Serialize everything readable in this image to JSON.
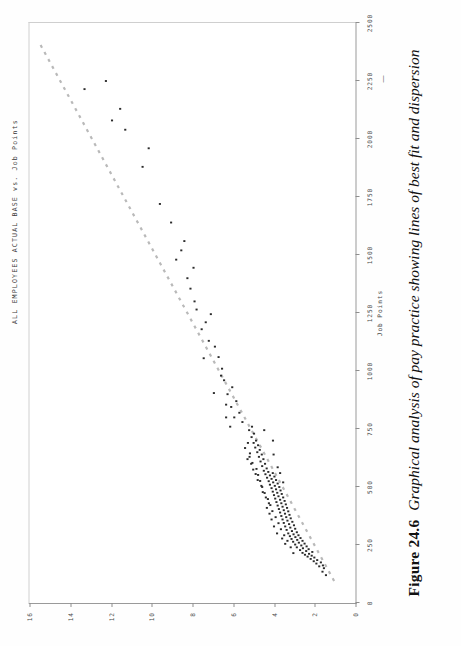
{
  "figure": {
    "number_label": "Figure 24.6",
    "caption_text": "Graphical analysis of pay practice showing lines of best fit and dispersion"
  },
  "chart_title": "ALL EMPLOYEES ACTUAL BASE vs. Job Points",
  "axis_marker_dash": "—",
  "colors": {
    "point": "#2b2b2b",
    "trendline": "#b9b9b9",
    "axis": "#8e8e8e",
    "frame": "#cfcfcf",
    "background": "#ffffff",
    "text": "#1a1a1a"
  },
  "chart_data": {
    "type": "scatter",
    "title": "ALL EMPLOYEES ACTUAL BASE vs. Job Points",
    "xlabel": "Job Points",
    "ylabel": "",
    "xlim": [
      0,
      2500
    ],
    "ylim": [
      0,
      16
    ],
    "grid": false,
    "legend": "none",
    "xticks": [
      0,
      250,
      500,
      750,
      1000,
      1250,
      1500,
      1750,
      2000,
      2250,
      2500
    ],
    "xtick_labels": [
      "0",
      "250",
      "500",
      "750",
      "1000",
      "1250",
      "1500",
      "1750",
      "2000",
      "2250",
      "2500"
    ],
    "yticks": [
      0,
      2,
      4,
      6,
      8,
      10,
      12,
      14,
      16
    ],
    "ytick_labels": [
      "0",
      "2",
      "4",
      "6",
      "8",
      "10",
      "12",
      "14",
      "16"
    ],
    "annotations": [
      "Job Points axis label placed beneath the 1250 tick"
    ],
    "series": [
      {
        "name": "Line of best fit",
        "type": "line",
        "style": "dotted",
        "color": "#b9b9b9",
        "x": [
          95,
          2420
        ],
        "y": [
          1.05,
          15.55
        ]
      },
      {
        "name": "Actual base salary",
        "type": "scatter",
        "color": "#2b2b2b",
        "points": [
          [
            120,
            1.45
          ],
          [
            135,
            1.62
          ],
          [
            150,
            1.55
          ],
          [
            158,
            1.78
          ],
          [
            162,
            1.6
          ],
          [
            170,
            1.92
          ],
          [
            175,
            1.7
          ],
          [
            180,
            2.05
          ],
          [
            185,
            1.88
          ],
          [
            190,
            2.2
          ],
          [
            196,
            2.02
          ],
          [
            200,
            2.35
          ],
          [
            204,
            2.15
          ],
          [
            208,
            2.48
          ],
          [
            212,
            2.28
          ],
          [
            216,
            2.6
          ],
          [
            220,
            2.12
          ],
          [
            224,
            2.42
          ],
          [
            228,
            2.72
          ],
          [
            232,
            2.3
          ],
          [
            236,
            2.58
          ],
          [
            240,
            2.88
          ],
          [
            244,
            2.4
          ],
          [
            248,
            2.66
          ],
          [
            252,
            2.96
          ],
          [
            256,
            2.5
          ],
          [
            260,
            2.78
          ],
          [
            264,
            3.06
          ],
          [
            268,
            2.6
          ],
          [
            272,
            2.86
          ],
          [
            276,
            3.14
          ],
          [
            280,
            2.7
          ],
          [
            284,
            2.95
          ],
          [
            288,
            3.22
          ],
          [
            292,
            2.8
          ],
          [
            296,
            3.04
          ],
          [
            300,
            3.3
          ],
          [
            305,
            2.88
          ],
          [
            310,
            3.12
          ],
          [
            315,
            3.38
          ],
          [
            320,
            2.96
          ],
          [
            325,
            3.2
          ],
          [
            330,
            3.45
          ],
          [
            335,
            3.02
          ],
          [
            340,
            3.26
          ],
          [
            345,
            3.52
          ],
          [
            350,
            3.1
          ],
          [
            355,
            3.34
          ],
          [
            360,
            3.58
          ],
          [
            365,
            3.18
          ],
          [
            370,
            3.4
          ],
          [
            375,
            3.64
          ],
          [
            380,
            3.24
          ],
          [
            385,
            3.46
          ],
          [
            390,
            3.7
          ],
          [
            395,
            3.3
          ],
          [
            400,
            3.52
          ],
          [
            405,
            3.76
          ],
          [
            410,
            3.36
          ],
          [
            415,
            3.58
          ],
          [
            420,
            3.82
          ],
          [
            425,
            3.42
          ],
          [
            430,
            3.64
          ],
          [
            435,
            3.88
          ],
          [
            440,
            3.48
          ],
          [
            445,
            3.7
          ],
          [
            450,
            3.94
          ],
          [
            455,
            3.55
          ],
          [
            460,
            3.78
          ],
          [
            465,
            4.0
          ],
          [
            470,
            3.62
          ],
          [
            475,
            3.84
          ],
          [
            480,
            4.06
          ],
          [
            485,
            3.68
          ],
          [
            490,
            3.9
          ],
          [
            495,
            4.12
          ],
          [
            500,
            3.74
          ],
          [
            505,
            3.96
          ],
          [
            510,
            4.2
          ],
          [
            515,
            3.82
          ],
          [
            520,
            4.04
          ],
          [
            525,
            4.26
          ],
          [
            530,
            3.9
          ],
          [
            535,
            4.12
          ],
          [
            540,
            4.34
          ],
          [
            545,
            3.98
          ],
          [
            550,
            4.2
          ],
          [
            555,
            4.42
          ],
          [
            560,
            4.06
          ],
          [
            565,
            4.28
          ],
          [
            570,
            4.5
          ],
          [
            580,
            4.36
          ],
          [
            590,
            4.58
          ],
          [
            600,
            4.44
          ],
          [
            610,
            4.66
          ],
          [
            620,
            4.52
          ],
          [
            630,
            4.74
          ],
          [
            640,
            4.6
          ],
          [
            650,
            4.82
          ],
          [
            660,
            4.7
          ],
          [
            670,
            4.92
          ],
          [
            680,
            4.78
          ],
          [
            690,
            5.0
          ],
          [
            700,
            4.88
          ],
          [
            715,
            5.1
          ],
          [
            730,
            4.98
          ],
          [
            745,
            5.22
          ],
          [
            760,
            5.08
          ],
          [
            430,
            4.25
          ],
          [
            455,
            4.4
          ],
          [
            478,
            4.55
          ],
          [
            505,
            4.62
          ],
          [
            530,
            4.8
          ],
          [
            556,
            4.9
          ],
          [
            575,
            5.02
          ],
          [
            600,
            5.12
          ],
          [
            620,
            5.3
          ],
          [
            645,
            5.18
          ],
          [
            668,
            5.42
          ],
          [
            690,
            5.28
          ],
          [
            300,
            3.85
          ],
          [
            330,
            4.0
          ],
          [
            360,
            4.12
          ],
          [
            385,
            4.22
          ],
          [
            410,
            4.35
          ],
          [
            255,
            3.45
          ],
          [
            278,
            3.6
          ],
          [
            215,
            3.05
          ],
          [
            240,
            3.18
          ],
          [
            268,
            3.34
          ],
          [
            292,
            3.5
          ],
          [
            318,
            3.66
          ],
          [
            344,
            3.78
          ],
          [
            370,
            3.92
          ],
          [
            396,
            4.08
          ],
          [
            422,
            4.18
          ],
          [
            448,
            4.3
          ],
          [
            474,
            4.46
          ],
          [
            500,
            4.58
          ],
          [
            526,
            4.68
          ],
          [
            552,
            4.78
          ],
          [
            578,
            4.86
          ],
          [
            604,
            5.06
          ],
          [
            630,
            5.2
          ],
          [
            780,
            5.55
          ],
          [
            800,
            5.95
          ],
          [
            820,
            5.7
          ],
          [
            845,
            6.1
          ],
          [
            870,
            5.85
          ],
          [
            900,
            6.28
          ],
          [
            930,
            6.05
          ],
          [
            960,
            6.45
          ],
          [
            700,
            4.05
          ],
          [
            745,
            4.48
          ],
          [
            640,
            4.02
          ],
          [
            585,
            3.82
          ],
          [
            560,
            3.7
          ],
          [
            520,
            3.55
          ],
          [
            760,
            6.15
          ],
          [
            800,
            6.35
          ],
          [
            1010,
            6.55
          ],
          [
            1060,
            6.72
          ],
          [
            1105,
            6.9
          ],
          [
            1180,
            7.55
          ],
          [
            1210,
            7.35
          ],
          [
            1245,
            7.1
          ],
          [
            1265,
            7.8
          ],
          [
            1300,
            7.9
          ],
          [
            1355,
            8.1
          ],
          [
            1400,
            8.25
          ],
          [
            1445,
            7.95
          ],
          [
            1520,
            8.55
          ],
          [
            1560,
            8.4
          ],
          [
            1720,
            9.6
          ],
          [
            1880,
            10.45
          ],
          [
            1960,
            10.15
          ],
          [
            2040,
            11.3
          ],
          [
            2080,
            11.95
          ],
          [
            2130,
            11.55
          ],
          [
            2215,
            13.3
          ],
          [
            2250,
            12.25
          ],
          [
            1640,
            9.05
          ],
          [
            1480,
            8.8
          ],
          [
            1130,
            7.2
          ],
          [
            980,
            6.6
          ],
          [
            905,
            6.95
          ],
          [
            855,
            6.35
          ],
          [
            1055,
            7.45
          ]
        ]
      }
    ]
  }
}
